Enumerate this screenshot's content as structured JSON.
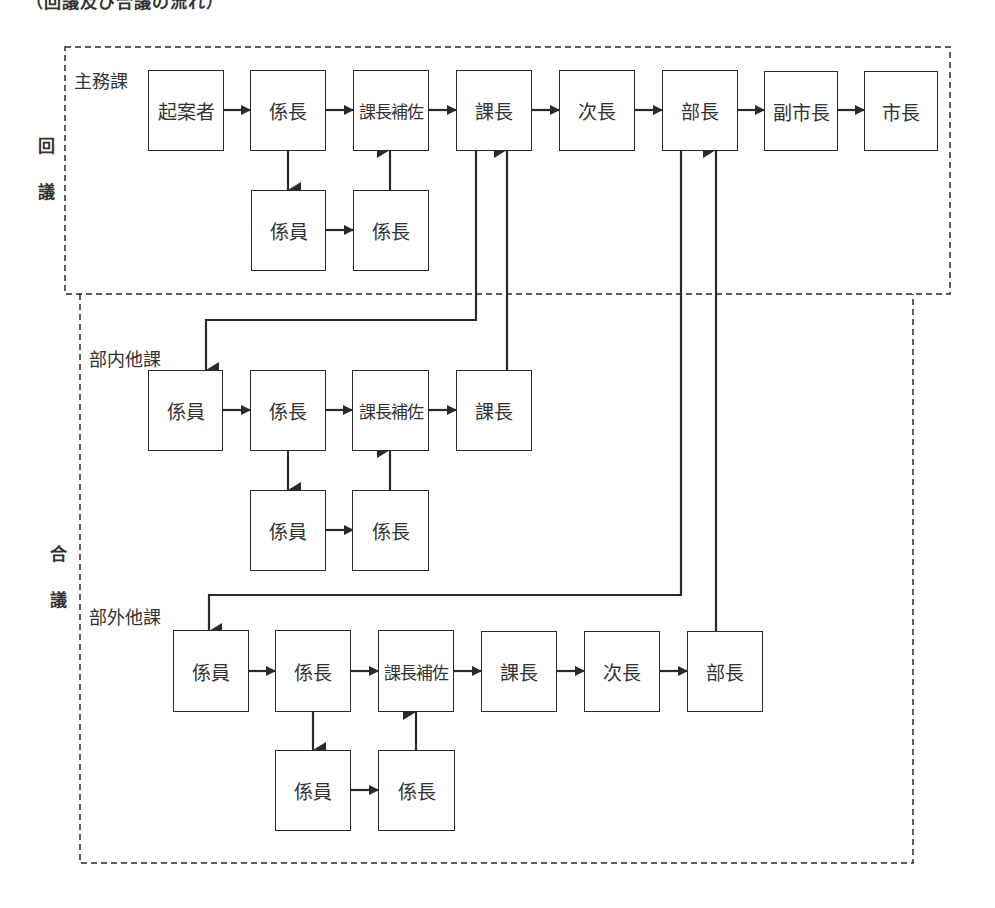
{
  "title": "（回議及び合議の流れ）",
  "side_labels": {
    "kaigi_1": "回",
    "kaigi_2": "議",
    "gougi_1": "合",
    "gougi_2": "議"
  },
  "groups": {
    "shumuka": {
      "label": "主務課",
      "main": [
        "起案者",
        "係長",
        "課長補佐",
        "課長",
        "次長",
        "部長",
        "副市長",
        "市長"
      ],
      "sub": [
        "係員",
        "係長"
      ]
    },
    "bunai": {
      "label": "部内他課",
      "main": [
        "係員",
        "係長",
        "課長補佐",
        "課長"
      ],
      "sub": [
        "係員",
        "係長"
      ]
    },
    "bugai": {
      "label": "部外他課",
      "main": [
        "係員",
        "係長",
        "課長補佐",
        "課長",
        "次長",
        "部長"
      ],
      "sub": [
        "係員",
        "係長"
      ]
    }
  },
  "colors": {
    "line": "#2a2a2a",
    "text": "#333333",
    "background": "#ffffff"
  }
}
